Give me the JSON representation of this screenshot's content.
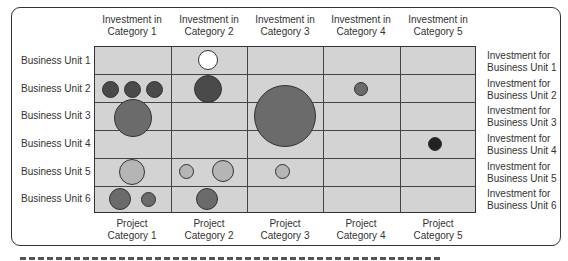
{
  "columns_top": [
    {
      "line1": "Investment in",
      "line2": "Category 1"
    },
    {
      "line1": "Investment in",
      "line2": "Category 2"
    },
    {
      "line1": "Investment in",
      "line2": "Category 3"
    },
    {
      "line1": "Investment in",
      "line2": "Category 4"
    },
    {
      "line1": "Investment in",
      "line2": "Category 5"
    }
  ],
  "columns_bottom": [
    {
      "line1": "Project",
      "line2": "Category 1"
    },
    {
      "line1": "Project",
      "line2": "Category 2"
    },
    {
      "line1": "Project",
      "line2": "Category 3"
    },
    {
      "line1": "Project",
      "line2": "Category 4"
    },
    {
      "line1": "Project",
      "line2": "Category 5"
    }
  ],
  "rows_left": [
    "Business Unit 1",
    "Business Unit 2",
    "Business Unit 3",
    "Business Unit 4",
    "Business Unit 5",
    "Business Unit 6"
  ],
  "rows_right": [
    {
      "line1": "Investment for",
      "line2": "Business Unit 1"
    },
    {
      "line1": "Investment for",
      "line2": "Business Unit 2"
    },
    {
      "line1": "Investment for",
      "line2": "Business Unit 3"
    },
    {
      "line1": "Investment for",
      "line2": "Business Unit 4"
    },
    {
      "line1": "Investment for",
      "line2": "Business Unit 5"
    },
    {
      "line1": "Investment for",
      "line2": "Business Unit 6"
    }
  ],
  "colors": {
    "grid_bg": "#d3d3d3",
    "grid_line": "#444444",
    "frame": "#333333",
    "bubble_white": "#ffffff",
    "bubble_dark": "#4a4a4a",
    "bubble_mid": "#6b6b6b",
    "bubble_light": "#b5b5b5",
    "bubble_black": "#222222"
  },
  "bubbles": [
    {
      "business_unit": 1,
      "category": 2,
      "cx": 208,
      "cy": 60,
      "r": 10,
      "shade": "white"
    },
    {
      "business_unit": 2,
      "category": 1,
      "cx": 110,
      "cy": 89,
      "r": 8.5,
      "shade": "dark"
    },
    {
      "business_unit": 2,
      "category": 1,
      "cx": 132,
      "cy": 89,
      "r": 8.5,
      "shade": "dark"
    },
    {
      "business_unit": 2,
      "category": 1,
      "cx": 154,
      "cy": 89,
      "r": 8.5,
      "shade": "dark"
    },
    {
      "business_unit": 2,
      "category": 2,
      "cx": 208,
      "cy": 89,
      "r": 14,
      "shade": "dark"
    },
    {
      "business_unit": 2,
      "category": 4,
      "cx": 361,
      "cy": 89,
      "r": 7,
      "shade": "mid"
    },
    {
      "business_unit": 3,
      "category": 1,
      "cx": 133,
      "cy": 118,
      "r": 19,
      "shade": "mid"
    },
    {
      "business_unit": 3,
      "category": 3,
      "cx": 285,
      "cy": 116,
      "r": 31,
      "shade": "mid"
    },
    {
      "business_unit": 4,
      "category": 5,
      "cx": 435,
      "cy": 144,
      "r": 7,
      "shade": "black"
    },
    {
      "business_unit": 5,
      "category": 1,
      "cx": 132,
      "cy": 172,
      "r": 13,
      "shade": "light"
    },
    {
      "business_unit": 5,
      "category": 2,
      "cx": 186,
      "cy": 171,
      "r": 7.5,
      "shade": "light"
    },
    {
      "business_unit": 5,
      "category": 2,
      "cx": 223,
      "cy": 171,
      "r": 11,
      "shade": "light"
    },
    {
      "business_unit": 5,
      "category": 3,
      "cx": 282,
      "cy": 171,
      "r": 7.5,
      "shade": "light"
    },
    {
      "business_unit": 6,
      "category": 1,
      "cx": 120,
      "cy": 199,
      "r": 11,
      "shade": "mid"
    },
    {
      "business_unit": 6,
      "category": 1,
      "cx": 148,
      "cy": 199,
      "r": 7.5,
      "shade": "mid"
    },
    {
      "business_unit": 6,
      "category": 2,
      "cx": 207,
      "cy": 199,
      "r": 11,
      "shade": "mid"
    }
  ]
}
